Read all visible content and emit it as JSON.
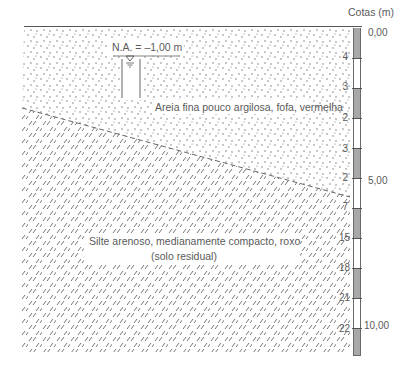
{
  "header": {
    "cotas_label": "Cotas (m)"
  },
  "water_level": {
    "label": "N.A. = –1,00 m"
  },
  "layers": [
    {
      "name": "sand",
      "label": "Areia fina pouco argilosa, fofa, vermelha"
    },
    {
      "name": "silt",
      "label_line1": "Silte arenoso, medianamente compacto, roxo",
      "label_line2": "(solo residual)"
    }
  ],
  "depths": [
    {
      "label": "0,00"
    },
    {
      "label": "5,00"
    },
    {
      "label": "10,00"
    }
  ],
  "spt": [
    "4",
    "3",
    "2",
    "3",
    "2",
    "7",
    "15",
    "18",
    "21",
    "22"
  ],
  "colors": {
    "gray_segment": "#a8a8a8",
    "line": "#555555"
  }
}
